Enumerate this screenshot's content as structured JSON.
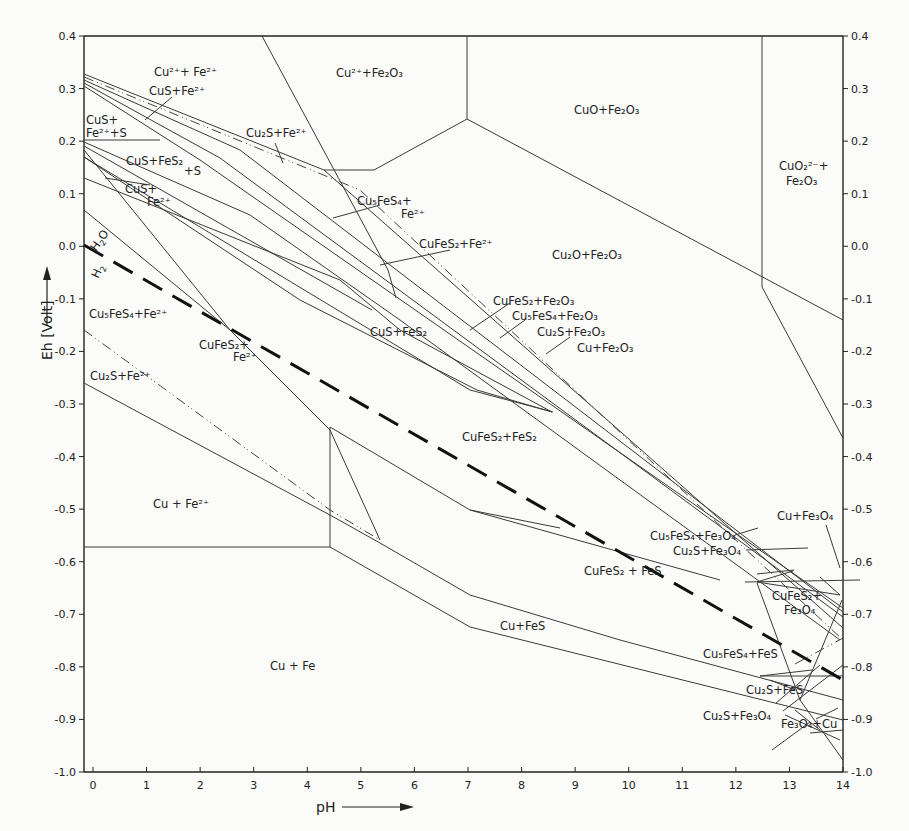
{
  "chart_data": {
    "type": "line",
    "xlabel": "pH",
    "ylabel": "Eh [Volt]",
    "xlim": [
      0,
      14
    ],
    "ylim": [
      -1.0,
      0.4
    ],
    "grid": false,
    "x_ticks": [
      "0",
      "1",
      "2",
      "3",
      "4",
      "5",
      "6",
      "7",
      "8",
      "9",
      "10",
      "11",
      "12",
      "13",
      "14"
    ],
    "y_ticks_left": [
      "0.4",
      "0.3",
      "0.2",
      "0.1",
      "0.0",
      "-0.1",
      "-0.2",
      "-0.3",
      "-0.4",
      "-0.5",
      "-0.6",
      "-0.7",
      "-0.8",
      "-0.9",
      "-1.0"
    ],
    "y_ticks_right": [
      "0.4",
      "0.3",
      "0.2",
      "0.1",
      "0.0",
      "-0.1",
      "-0.2",
      "-0.3",
      "-0.4",
      "-0.5",
      "-0.6",
      "-0.7",
      "-0.8",
      "-0.9",
      "-1.0"
    ],
    "water_line": {
      "label_upper": "H2O",
      "label_lower": "H2",
      "from": [
        0,
        0.0
      ],
      "to": [
        14,
        -0.83
      ],
      "style": "dashed"
    },
    "fields": [
      {
        "label": "Cu²⁺+Fe²⁺",
        "pH": 2.0,
        "Eh": 0.35
      },
      {
        "label": "CuS+Fe²⁺",
        "pH": 1.9,
        "Eh": 0.31
      },
      {
        "label": "CuS+ Fe²⁺+S",
        "pH": 0.3,
        "Eh": 0.24
      },
      {
        "label": "CuS+FeS₂+S",
        "pH": 1.5,
        "Eh": 0.16
      },
      {
        "label": "CuS+ Fe²⁺",
        "pH": 1.6,
        "Eh": 0.11
      },
      {
        "label": "Cu²⁺+Fe₂O₃",
        "pH": 5.0,
        "Eh": 0.34
      },
      {
        "label": "CuO+Fe₂O₃",
        "pH": 9.5,
        "Eh": 0.27
      },
      {
        "label": "CuO₂²⁻+ Fe₂O₃",
        "pH": 13.2,
        "Eh": 0.11
      },
      {
        "label": "Cu₂S+Fe²⁺",
        "pH": 3.3,
        "Eh": 0.23
      },
      {
        "label": "Cu₅FeS₄+ Fe²⁺",
        "pH": 5.0,
        "Eh": 0.1
      },
      {
        "label": "CuFeS₂+Fe²⁺",
        "pH": 6.0,
        "Eh": 0.02
      },
      {
        "label": "Cu₂O+Fe₂O₃",
        "pH": 9.7,
        "Eh": -0.01
      },
      {
        "label": "CuFeS₂+Fe₂O₃",
        "pH": 7.8,
        "Eh": -0.09
      },
      {
        "label": "Cu₅FeS₄+Fe₂O₃",
        "pH": 8.5,
        "Eh": -0.12
      },
      {
        "label": "Cu₂S+Fe₂O₃",
        "pH": 8.9,
        "Eh": -0.15
      },
      {
        "label": "Cu+Fe₂O₃",
        "pH": 9.5,
        "Eh": -0.18
      },
      {
        "label": "CuS+FeS₂",
        "pH": 5.5,
        "Eh": -0.14
      },
      {
        "label": "Cu₅FeS₄+Fe²⁺",
        "pH": 1.4,
        "Eh": -0.14
      },
      {
        "label": "CuFeS₂+ Fe²⁺",
        "pH": 2.6,
        "Eh": -0.18
      },
      {
        "label": "Cu₂S+Fe²⁺",
        "pH": 0.8,
        "Eh": -0.24
      },
      {
        "label": "CuFeS₂+FeS₂",
        "pH": 8.0,
        "Eh": -0.39
      },
      {
        "label": "Cu+Fe²⁺",
        "pH": 2.2,
        "Eh": -0.49
      },
      {
        "label": "CuFeS₂+FeS",
        "pH": 10.0,
        "Eh": -0.63
      },
      {
        "label": "Cu+FeS",
        "pH": 7.5,
        "Eh": -0.73
      },
      {
        "label": "Cu+Fe",
        "pH": 3.3,
        "Eh": -0.81
      },
      {
        "label": "Cu+Fe₃O₄",
        "pH": 13.0,
        "Eh": -0.53
      },
      {
        "label": "Cu₅FeS₄+Fe₃O₄",
        "pH": 11.4,
        "Eh": -0.56
      },
      {
        "label": "Cu₂S+Fe₃O₄",
        "pH": 11.8,
        "Eh": -0.59
      },
      {
        "label": "CuFeS₂+ Fe₃O₄",
        "pH": 13.0,
        "Eh": -0.69
      },
      {
        "label": "Cu₅FeS₄+FeS",
        "pH": 12.1,
        "Eh": -0.8
      },
      {
        "label": "Cu₂S+FeS",
        "pH": 12.4,
        "Eh": -0.85
      },
      {
        "label": "Cu₂S+Fe₃O₄",
        "pH": 11.8,
        "Eh": -0.9
      },
      {
        "label": "Fe₃O₄+Cu",
        "pH": 13.2,
        "Eh": -0.93
      }
    ]
  },
  "labels": {
    "xlabel": "pH",
    "ylabel": "Eh [Volt]",
    "h2o": "H",
    "h2o_sub": "2",
    "h2o_o": "O",
    "h2": "H",
    "h2_sub": "2"
  },
  "fields": {
    "cu2_fe2": "Cu²⁺+ Fe²⁺",
    "cus_fe2_top": "CuS+Fe²⁺",
    "cus_fe2s_1": "CuS+",
    "cus_fe2s_2": "Fe²⁺+S",
    "cus_fes2s_1": "CuS+FeS₂",
    "cus_fes2s_2": "+S",
    "cus_fe2_1": "CuS+",
    "cus_fe2_2": "Fe²⁺",
    "cu2_fe2o3": "Cu²⁺+Fe₂O₃",
    "cuo_fe2o3": "CuO+Fe₂O₃",
    "cuo2_1": "CuO₂²⁻+",
    "cuo2_2": "Fe₂O₃",
    "cu2s_fe2": "Cu₂S+Fe²⁺",
    "cu5fes4_fe2_1": "Cu₅FeS₄+",
    "cu5fes4_fe2_2": "Fe²⁺",
    "cufes2_fe2": "CuFeS₂+Fe²⁺",
    "cu2o_fe2o3": "Cu₂O+Fe₂O₃",
    "cufes2_fe2o3": "CuFeS₂+Fe₂O₃",
    "cu5fes4_fe2o3": "Cu₅FeS₄+Fe₂O₃",
    "cu2s_fe2o3": "Cu₂S+Fe₂O₃",
    "cu_fe2o3": "Cu+Fe₂O₃",
    "cus_fes2": "CuS+FeS₂",
    "cu5fes4_fe2_left": "Cu₅FeS₄+Fe²⁺",
    "cufes2_fe2_left_1": "CuFeS₂+",
    "cufes2_fe2_left_2": "Fe²⁺",
    "cu2s_fe2_left": "Cu₂S+Fe²⁺",
    "cufes2_fes2": "CuFeS₂+FeS₂",
    "cu_fe2": "Cu + Fe²⁺",
    "cufes2_fes": "CuFeS₂ + FeS",
    "cu_fes": "Cu+FeS",
    "cu_fe": "Cu + Fe",
    "cu_fe3o4": "Cu+Fe₃O₄",
    "cu5fes4_fe3o4": "Cu₅FeS₄+Fe₃O₄",
    "cu2s_fe3o4_top": "Cu₂S+Fe₃O₄",
    "cufes2_fe3o4_1": "CuFeS₂+",
    "cufes2_fe3o4_2": "Fe₃O₄",
    "cu5fes4_fes": "Cu₅FeS₄+FeS",
    "cu2s_fes": "Cu₂S+FeS",
    "cu2s_fe3o4_bot": "Cu₂S+Fe₃O₄",
    "fe3o4_cu": "Fe₃O₄+Cu"
  }
}
